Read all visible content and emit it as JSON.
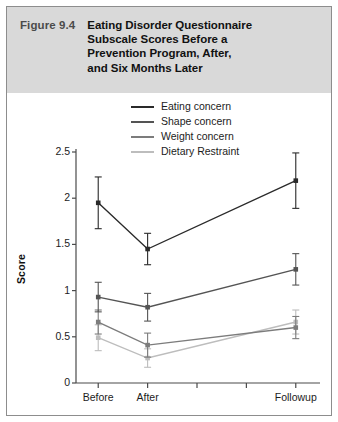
{
  "figure": {
    "number": "Figure 9.4",
    "title_lines": [
      "Eating Disorder Questionnaire",
      "Subscale Scores Before a",
      "Prevention Program, After,",
      "and Six Months Later"
    ],
    "title_full": "Eating Disorder Questionnaire Subscale Scores Before a Prevention Program, After, and Six Months Later"
  },
  "chart_data": {
    "type": "line",
    "title": "Eating Disorder Questionnaire Subscale Scores Before a Prevention Program, After, and Six Months Later",
    "xlabel": "",
    "ylabel": "Score",
    "categories": [
      "Before",
      "After",
      "Followup"
    ],
    "x": [
      0,
      1,
      4
    ],
    "xlim": [
      -0.45,
      4.45
    ],
    "ylim": [
      0,
      2.5
    ],
    "yticks": [
      0,
      0.5,
      1,
      1.5,
      2,
      2.5
    ],
    "ytick_labels": [
      "0",
      "0.5",
      "1",
      "1.5",
      "2",
      "2.5"
    ],
    "xticks": [
      0,
      1,
      2,
      3,
      4
    ],
    "xtick_labels": [
      "Before",
      "After",
      "",
      "",
      "Followup"
    ],
    "grid": false,
    "legend_position": "top-center",
    "error_bars": "vertical capped",
    "series": [
      {
        "name": "Eating concern",
        "color": "#2a2a2a",
        "values": [
          1.95,
          1.45,
          2.19
        ],
        "err_low": [
          0.28,
          0.17,
          0.3
        ],
        "err_high": [
          0.28,
          0.17,
          0.3
        ]
      },
      {
        "name": "Shape concern",
        "color": "#545454",
        "values": [
          0.93,
          0.82,
          1.23
        ],
        "err_low": [
          0.16,
          0.15,
          0.17
        ],
        "err_high": [
          0.16,
          0.15,
          0.17
        ]
      },
      {
        "name": "Weight concern",
        "color": "#7c7c7c",
        "values": [
          0.66,
          0.41,
          0.6
        ],
        "err_low": [
          0.13,
          0.13,
          0.12
        ],
        "err_high": [
          0.13,
          0.13,
          0.12
        ]
      },
      {
        "name": "Dietary Restraint",
        "color": "#bdbdbd",
        "values": [
          0.49,
          0.27,
          0.66
        ],
        "err_low": [
          0.14,
          0.1,
          0.13
        ],
        "err_high": [
          0.14,
          0.1,
          0.13
        ]
      }
    ]
  }
}
